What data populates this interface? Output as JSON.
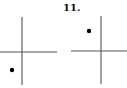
{
  "problem": {
    "number_label": "11."
  },
  "diagrams": [
    {
      "name": "left-axes",
      "vertical_axis": {
        "x": 22,
        "y1": 17,
        "y2": 85
      },
      "horizontal_axis": {
        "y": 52,
        "x1": 0,
        "x2": 57
      },
      "point": {
        "cx": 12,
        "cy": 70,
        "r": 2.2,
        "quadrant": "III"
      }
    },
    {
      "name": "right-axes",
      "vertical_axis": {
        "x": 101,
        "y1": 16,
        "y2": 84
      },
      "horizontal_axis": {
        "y": 51,
        "x1": 71,
        "x2": 127
      },
      "point": {
        "cx": 89,
        "cy": 31,
        "r": 2.2,
        "quadrant": "II"
      }
    }
  ],
  "colors": {
    "line": "#555555",
    "point": "#000000"
  }
}
